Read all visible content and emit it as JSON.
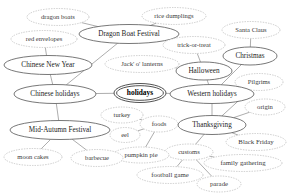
{
  "diagram": {
    "type": "node-link-graph",
    "canvas": {
      "width": 293,
      "height": 196,
      "background": "#ffffff"
    },
    "styles": {
      "solid_stroke": "#555555",
      "dashed_stroke": "#b6b6b6",
      "edge_stroke": "#8a8a8a",
      "root_stroke": "#3d3d3d",
      "label_color": "#1c1c1c"
    },
    "nodes": [
      {
        "id": "dragon_boats",
        "label": "dragon boats",
        "cx": 58,
        "cy": 17,
        "rx": 31,
        "ry": 8.5,
        "shape": "ellipse",
        "border": "dashed",
        "font": 6.6
      },
      {
        "id": "rice_dumplings",
        "label": "rice dumplings",
        "cx": 174,
        "cy": 16,
        "rx": 32,
        "ry": 8.5,
        "shape": "ellipse",
        "border": "dashed",
        "font": 6.6
      },
      {
        "id": "santa_claus",
        "label": "Santa Claus",
        "cx": 251,
        "cy": 30,
        "rx": 29,
        "ry": 8.5,
        "shape": "ellipse",
        "border": "dashed",
        "font": 6.6
      },
      {
        "id": "red_envelopes",
        "label": "red envelopes",
        "cx": 44,
        "cy": 39,
        "rx": 33,
        "ry": 8.5,
        "shape": "ellipse",
        "border": "dashed",
        "font": 6.6
      },
      {
        "id": "dragon_boat_fest",
        "label": "Dragon Boat Festival",
        "cx": 129,
        "cy": 34,
        "rx": 50,
        "ry": 9.5,
        "shape": "ellipse",
        "border": "solid",
        "font": 7.2
      },
      {
        "id": "trick_or_treat",
        "label": "trick-or-treat",
        "cx": 194,
        "cy": 45,
        "rx": 31,
        "ry": 8.5,
        "shape": "ellipse",
        "border": "dashed",
        "font": 6.6
      },
      {
        "id": "christmas",
        "label": "Christmas",
        "cx": 250,
        "cy": 56,
        "rx": 27,
        "ry": 9,
        "shape": "ellipse",
        "border": "solid",
        "font": 7.2
      },
      {
        "id": "chinese_new_year",
        "label": "Chinese New Year",
        "cx": 48,
        "cy": 65,
        "rx": 44,
        "ry": 9.5,
        "shape": "ellipse",
        "border": "solid",
        "font": 7.2
      },
      {
        "id": "jack_o_lanterns",
        "label": "Jack' o' lanterns",
        "cx": 142,
        "cy": 64,
        "rx": 37,
        "ry": 8.5,
        "shape": "ellipse",
        "border": "dashed",
        "font": 6.6
      },
      {
        "id": "halloween",
        "label": "Halloween",
        "cx": 204,
        "cy": 71,
        "rx": 28,
        "ry": 9,
        "shape": "ellipse",
        "border": "solid",
        "font": 7.2
      },
      {
        "id": "pilgrims",
        "label": "Pilgrims",
        "cx": 259,
        "cy": 82,
        "rx": 24,
        "ry": 8.5,
        "shape": "ellipse",
        "border": "dashed",
        "font": 6.6
      },
      {
        "id": "chinese_holidays",
        "label": "Chinese holidays",
        "cx": 55,
        "cy": 94,
        "rx": 41,
        "ry": 9.5,
        "shape": "ellipse",
        "border": "solid",
        "font": 7.2
      },
      {
        "id": "holidays",
        "label": "holidays",
        "cx": 140,
        "cy": 93,
        "rx": 26,
        "ry": 9.5,
        "shape": "doubleellipse",
        "border": "root",
        "font": 7.4
      },
      {
        "id": "western_holidays",
        "label": "Western holidays",
        "cx": 212,
        "cy": 94,
        "rx": 42,
        "ry": 9.5,
        "shape": "ellipse",
        "border": "solid",
        "font": 7.2
      },
      {
        "id": "origin",
        "label": "origin",
        "cx": 265,
        "cy": 107,
        "rx": 20,
        "ry": 8,
        "shape": "ellipse",
        "border": "dashed",
        "font": 6.6
      },
      {
        "id": "turkey",
        "label": "turkey",
        "cx": 122,
        "cy": 115,
        "rx": 21,
        "ry": 8,
        "shape": "ellipse",
        "border": "dashed",
        "font": 6.6
      },
      {
        "id": "foods",
        "label": "foods",
        "cx": 159,
        "cy": 124,
        "rx": 19,
        "ry": 8,
        "shape": "ellipse",
        "border": "dashed",
        "font": 6.6
      },
      {
        "id": "thanksgiving",
        "label": "Thanksgiving",
        "cx": 212,
        "cy": 125,
        "rx": 34,
        "ry": 9.5,
        "shape": "ellipse",
        "border": "solid",
        "font": 7.2
      },
      {
        "id": "mid_autumn_fest",
        "label": "Mid-Autumn Festival",
        "cx": 60,
        "cy": 130,
        "rx": 50,
        "ry": 9.5,
        "shape": "ellipse",
        "border": "solid",
        "font": 7.2
      },
      {
        "id": "eel",
        "label": "eel",
        "cx": 125,
        "cy": 135,
        "rx": 15,
        "ry": 7.5,
        "shape": "ellipse",
        "border": "dashed",
        "font": 6.6
      },
      {
        "id": "black_friday",
        "label": "Black Friday",
        "cx": 256,
        "cy": 142,
        "rx": 30,
        "ry": 8.5,
        "shape": "ellipse",
        "border": "dashed",
        "font": 6.8
      },
      {
        "id": "customs",
        "label": "customs",
        "cx": 189,
        "cy": 152,
        "rx": 24,
        "ry": 8,
        "shape": "ellipse",
        "border": "dashed",
        "font": 6.6
      },
      {
        "id": "pumpkin_pie",
        "label": "pumpkin pie",
        "cx": 141,
        "cy": 155,
        "rx": 28,
        "ry": 8,
        "shape": "ellipse",
        "border": "dashed",
        "font": 6.6
      },
      {
        "id": "moon_cakes",
        "label": "moon cakes",
        "cx": 33,
        "cy": 157,
        "rx": 29,
        "ry": 8.5,
        "shape": "ellipse",
        "border": "dashed",
        "font": 6.6
      },
      {
        "id": "barbecue",
        "label": "barbecue",
        "cx": 97,
        "cy": 158,
        "rx": 26,
        "ry": 8.5,
        "shape": "ellipse",
        "border": "dashed",
        "font": 6.6
      },
      {
        "id": "family_gathering",
        "label": "family gathering",
        "cx": 243,
        "cy": 163,
        "rx": 39,
        "ry": 8.5,
        "shape": "ellipse",
        "border": "dashed",
        "font": 6.8
      },
      {
        "id": "football_game",
        "label": "football game",
        "cx": 170,
        "cy": 175,
        "rx": 33,
        "ry": 8.5,
        "shape": "ellipse",
        "border": "dashed",
        "font": 6.8
      },
      {
        "id": "parade",
        "label": "parade",
        "cx": 219,
        "cy": 184,
        "rx": 22,
        "ry": 8,
        "shape": "ellipse",
        "border": "dashed",
        "font": 6.8
      }
    ],
    "edges": [
      {
        "from": "holidays",
        "to": "chinese_holidays"
      },
      {
        "from": "holidays",
        "to": "western_holidays"
      },
      {
        "from": "chinese_holidays",
        "to": "dragon_boat_fest"
      },
      {
        "from": "chinese_holidays",
        "to": "chinese_new_year"
      },
      {
        "from": "chinese_holidays",
        "to": "mid_autumn_fest"
      },
      {
        "from": "dragon_boat_fest",
        "to": "dragon_boats"
      },
      {
        "from": "dragon_boat_fest",
        "to": "rice_dumplings"
      },
      {
        "from": "chinese_new_year",
        "to": "red_envelopes"
      },
      {
        "from": "mid_autumn_fest",
        "to": "moon_cakes"
      },
      {
        "from": "mid_autumn_fest",
        "to": "barbecue"
      },
      {
        "from": "western_holidays",
        "to": "halloween"
      },
      {
        "from": "western_holidays",
        "to": "christmas"
      },
      {
        "from": "western_holidays",
        "to": "thanksgiving"
      },
      {
        "from": "halloween",
        "to": "trick_or_treat"
      },
      {
        "from": "halloween",
        "to": "jack_o_lanterns"
      },
      {
        "from": "christmas",
        "to": "santa_claus"
      },
      {
        "from": "thanksgiving",
        "to": "origin"
      },
      {
        "from": "thanksgiving",
        "to": "pilgrims"
      },
      {
        "from": "thanksgiving",
        "to": "foods"
      },
      {
        "from": "thanksgiving",
        "to": "customs"
      },
      {
        "from": "thanksgiving",
        "to": "black_friday"
      },
      {
        "from": "foods",
        "to": "turkey"
      },
      {
        "from": "foods",
        "to": "eel"
      },
      {
        "from": "foods",
        "to": "pumpkin_pie"
      },
      {
        "from": "customs",
        "to": "family_gathering"
      },
      {
        "from": "customs",
        "to": "football_game"
      },
      {
        "from": "customs",
        "to": "parade"
      }
    ]
  }
}
